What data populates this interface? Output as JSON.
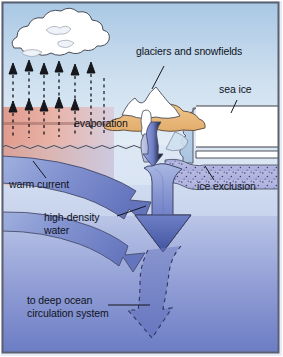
{
  "diagram": {
    "type": "cross-section-schematic",
    "labels": [
      {
        "id": "glaciers",
        "text": "glaciers and snowfields",
        "x": 136,
        "y": 52
      },
      {
        "id": "sea_ice",
        "text": "sea ice",
        "x": 220,
        "y": 88
      },
      {
        "id": "evaporation",
        "text": "evaporation",
        "x": 75,
        "y": 122
      },
      {
        "id": "warm_current",
        "text": "warm current",
        "x": 10,
        "y": 183
      },
      {
        "id": "ice_exclusion",
        "text": "ice exclusion",
        "x": 198,
        "y": 185
      },
      {
        "id": "high_density_water",
        "text": "high-density\nwater",
        "x": 45,
        "y": 217
      },
      {
        "id": "to_deep_ocean",
        "text": "to deep ocean\ncirculation system",
        "x": 28,
        "y": 300
      }
    ],
    "elements": [
      {
        "id": "cloud",
        "name": "rain-cloud",
        "description": "white cumulus cloud upper left"
      },
      {
        "id": "evaporation-arrows",
        "name": "evaporation-arrows",
        "description": "dashed upward arrows rising from sea surface"
      },
      {
        "id": "mountain",
        "name": "glacier-mountain",
        "description": "snow capped peaks over tan land with glacier tongue"
      },
      {
        "id": "sea-ice-slab",
        "name": "sea-ice-slab",
        "description": "white ice shelf slab at right"
      },
      {
        "id": "ice-exclusion-band",
        "name": "ice-exclusion-band",
        "description": "speckled purple brine rejection band under sea ice"
      },
      {
        "id": "warm-current-arrow",
        "name": "warm-current-arrow",
        "description": "broad arrow entering from left"
      },
      {
        "id": "sinking-arrow",
        "name": "sinking-arrow",
        "description": "large arrow plunging downward"
      },
      {
        "id": "deep-return-arrow",
        "name": "deep-return-arrow",
        "description": "dashed outline arrow continuing to deep ocean"
      }
    ],
    "colors": {
      "sky": "#bdd5ea",
      "warm_water": "#e8a79a",
      "cool_water": "#cfe0ef",
      "deep_water": "#7f8fd0",
      "arrow_blue": "#6376bd",
      "ice_white": "#ffffff",
      "land_tan": "#e8b87a",
      "outline": "#3d3f46",
      "text": "#10131c"
    }
  }
}
